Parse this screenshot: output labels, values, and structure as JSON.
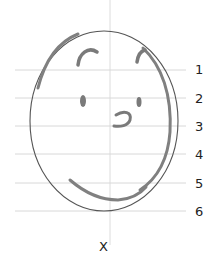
{
  "diagram": {
    "type": "face-proportion-sketch",
    "guide_lines": [
      {
        "label": "1",
        "y": 70
      },
      {
        "label": "2",
        "y": 98
      },
      {
        "label": "3",
        "y": 126
      },
      {
        "label": "4",
        "y": 154
      },
      {
        "label": "5",
        "y": 183
      },
      {
        "label": "6",
        "y": 211
      }
    ],
    "vertical_axis_label": "X",
    "colors": {
      "guide_line": "#d8d8d8",
      "outline": "#555555",
      "sketch_stroke": "#808080",
      "label": "#222222"
    }
  }
}
